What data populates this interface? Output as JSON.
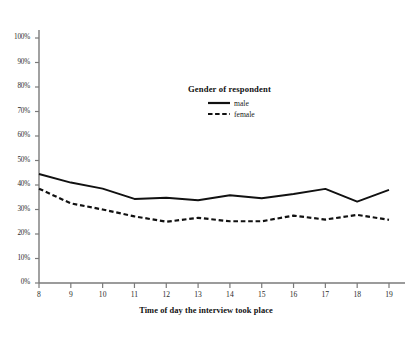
{
  "chart_data": {
    "type": "line",
    "title": "",
    "xlabel": "Time of day the interview took place",
    "ylabel": "",
    "xlim": [
      8,
      19
    ],
    "ylim": [
      0,
      100
    ],
    "grid": false,
    "legend_position": "upper-center",
    "legend_title": "Gender of respondent",
    "x": [
      8,
      9,
      10,
      11,
      12,
      13,
      14,
      15,
      16,
      17,
      18,
      19
    ],
    "x_tick_labels": [
      "8",
      "9",
      "10",
      "11",
      "12",
      "13",
      "14",
      "15",
      "16",
      "17",
      "18",
      "19"
    ],
    "y_tick_labels": [
      "0%",
      "10%",
      "20%",
      "30%",
      "40%",
      "50%",
      "60%",
      "70%",
      "80%",
      "90%",
      "100%"
    ],
    "y_tick_values": [
      0,
      10,
      20,
      30,
      40,
      50,
      60,
      70,
      80,
      90,
      100
    ],
    "series": [
      {
        "name": "male",
        "style": "solid",
        "color": "#111111",
        "values": [
          44.5,
          41.0,
          38.5,
          34.3,
          34.8,
          33.8,
          35.8,
          34.6,
          36.3,
          38.4,
          33.2,
          38.0
        ]
      },
      {
        "name": "female",
        "style": "dashed",
        "color": "#111111",
        "values": [
          38.5,
          32.5,
          30.0,
          27.2,
          25.0,
          26.6,
          25.2,
          25.2,
          27.5,
          25.9,
          27.8,
          25.8
        ]
      }
    ]
  },
  "axis": {
    "x_title": "Time of day the interview took place"
  },
  "legend": {
    "title": "Gender of respondent",
    "entries": [
      {
        "label": "male"
      },
      {
        "label": "female"
      }
    ]
  },
  "colors": {
    "axis": "#7a7a7a",
    "line": "#111111",
    "text": "#1a1a1a",
    "background": "#ffffff"
  }
}
